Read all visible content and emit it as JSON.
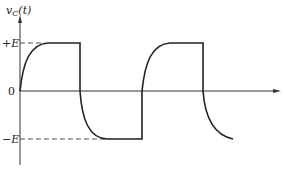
{
  "figure": {
    "y_axis_label": "v",
    "y_axis_label_sub": "C",
    "y_axis_label_arg": "(t)",
    "level_labels": {
      "positive": "+E",
      "zero": "0",
      "negative": "−E"
    },
    "x_axis_arrow": "time-axis-arrow"
  },
  "waveform": {
    "description": "Capacitor voltage charging/discharging exponentially between +E and -E under square-wave input",
    "levels": {
      "high": 1,
      "zero": 0,
      "low": -1
    },
    "segments": [
      {
        "type": "exp-rise",
        "from": 0,
        "to": 1
      },
      {
        "type": "flat",
        "value": 1
      },
      {
        "type": "step",
        "from": 1,
        "to": 0
      },
      {
        "type": "exp-fall",
        "from": 0,
        "to": -1
      },
      {
        "type": "flat",
        "value": -1
      },
      {
        "type": "step",
        "from": -1,
        "to": 0
      },
      {
        "type": "exp-rise",
        "from": 0,
        "to": 1
      },
      {
        "type": "flat",
        "value": 1
      },
      {
        "type": "step",
        "from": 1,
        "to": 0
      },
      {
        "type": "exp-fall",
        "from": 0,
        "to": -1
      }
    ]
  }
}
